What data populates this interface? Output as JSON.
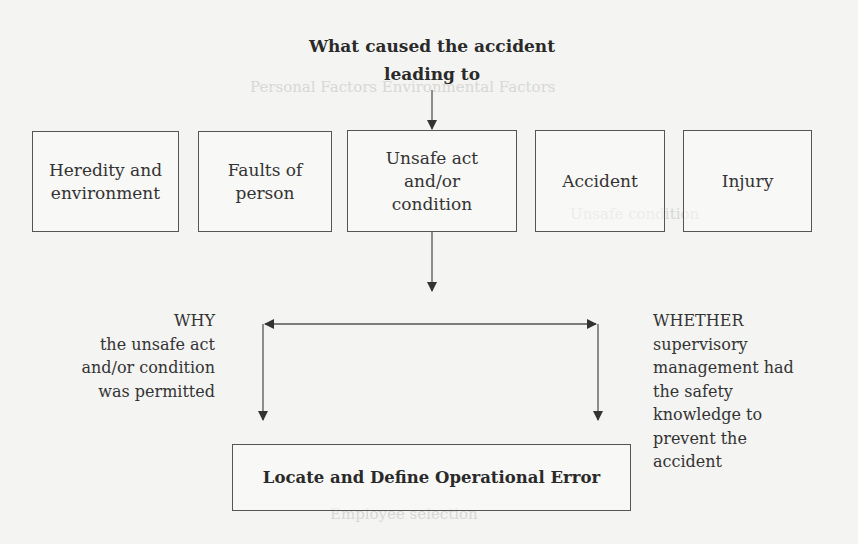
{
  "diagram": {
    "title_lines": [
      "What caused the accident",
      "leading to"
    ],
    "chain_boxes": [
      {
        "id": "heredity",
        "lines": [
          "Heredity and",
          "environment"
        ]
      },
      {
        "id": "faults",
        "lines": [
          "Faults of",
          "person"
        ]
      },
      {
        "id": "unsafe",
        "lines": [
          "Unsafe act",
          "and/or",
          "condition"
        ]
      },
      {
        "id": "accident",
        "lines": [
          "Accident"
        ]
      },
      {
        "id": "injury",
        "lines": [
          "Injury"
        ]
      }
    ],
    "why_text": [
      "WHY",
      "the unsafe act",
      "and/or condition",
      "was permitted"
    ],
    "whether_text": [
      "WHETHER",
      "supervisory",
      "management had",
      "the safety",
      "knowledge to",
      "prevent the",
      "accident"
    ],
    "final_box": "Locate and Define Operational Error",
    "colors": {
      "line": "#444444",
      "text": "#333333",
      "background": "#f4f4f2"
    }
  }
}
